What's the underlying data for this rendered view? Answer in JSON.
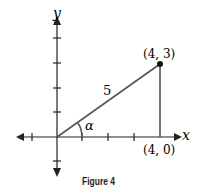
{
  "figure": {
    "caption": "Figure 4",
    "axis_labels": {
      "x": "x",
      "y": "y"
    },
    "points": [
      {
        "label": "(4, 3)",
        "x": 4,
        "y": 3
      },
      {
        "label": "(4, 0)",
        "x": 4,
        "y": 0
      }
    ],
    "hypotenuse_label": "5",
    "angle_label": "α",
    "colors": {
      "line": "#555555",
      "axis": "#222222"
    }
  }
}
